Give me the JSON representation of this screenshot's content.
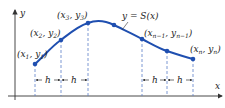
{
  "diagram": {
    "axes": {
      "x_label": "x",
      "y_label": "y"
    },
    "curve_label": "y = S(x)",
    "points": [
      {
        "label": "(x1, y1)",
        "base": "x",
        "i": "1",
        "base2": "y"
      },
      {
        "label": "(x2, y2)",
        "base": "x",
        "i": "2",
        "base2": "y"
      },
      {
        "label": "(x3, y3)",
        "base": "x",
        "i": "3",
        "base2": "y"
      },
      {
        "label": "",
        "base": "",
        "i": "",
        "base2": ""
      },
      {
        "label": "(xn-1, yn-1)",
        "base": "x",
        "i": "n−1",
        "base2": "y"
      },
      {
        "label": "",
        "base": "",
        "i": "",
        "base2": ""
      },
      {
        "label": "(xn, yn)",
        "base": "x",
        "i": "n",
        "base2": "y"
      }
    ],
    "spacing_label": "h",
    "colors": {
      "curve": "#1f4fb0",
      "dash": "#5a7fc8",
      "axis": "#333333"
    }
  }
}
